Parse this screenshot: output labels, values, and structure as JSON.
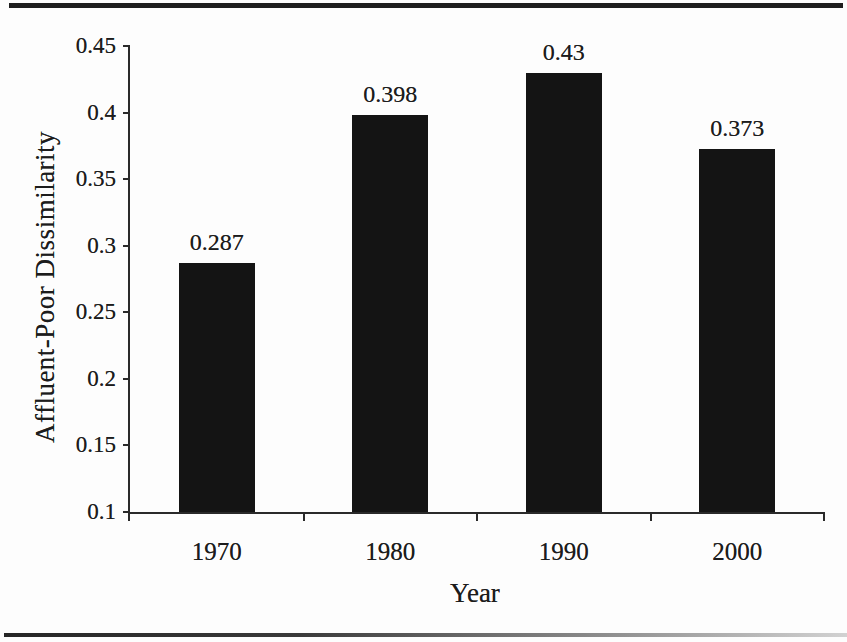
{
  "figure": {
    "background": "#fdfdfd",
    "top_rule_color": "#1e1e1e",
    "bottom_rule_color": "#2e2e2e"
  },
  "chart_data": {
    "type": "bar",
    "categories": [
      "1970",
      "1980",
      "1990",
      "2000"
    ],
    "values": [
      0.287,
      0.398,
      0.43,
      0.373
    ],
    "bar_labels": [
      "0.287",
      "0.398",
      "0.43",
      "0.373"
    ],
    "xlabel": "Year",
    "ylabel": "Affluent-Poor Dissimilarity",
    "ylim": [
      0.1,
      0.45
    ],
    "ytick_values": [
      0.45,
      0.4,
      0.35,
      0.3,
      0.25,
      0.2,
      0.15,
      0.1
    ],
    "ytick_labels": [
      "0.45",
      "0.4",
      "0.35",
      "0.3",
      "0.25",
      "0.2",
      "0.15",
      "0.1"
    ],
    "grid": false,
    "legend": null,
    "bar_color": "#141414",
    "axis_color": "#2a2a2a",
    "text_color": "#1c1c1c"
  }
}
